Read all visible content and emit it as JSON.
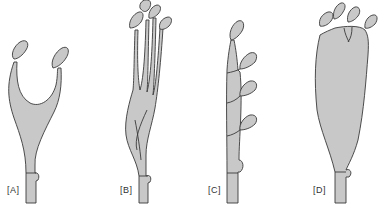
{
  "figure": {
    "panels": [
      {
        "label": "[A]",
        "description": "Two stamens with filaments fused into a U-shaped base"
      },
      {
        "label": "[B]",
        "description": "Four stamens with long filaments fused at lower portion"
      },
      {
        "label": "[C]",
        "description": "Stamens arranged along a central column at intervals"
      },
      {
        "label": "[D]",
        "description": "Four stamens on top of a broad inflated fused column"
      }
    ],
    "colors": {
      "fill": "#c8c8c8",
      "stroke": "#3a3a3a",
      "background": "#ffffff"
    }
  }
}
